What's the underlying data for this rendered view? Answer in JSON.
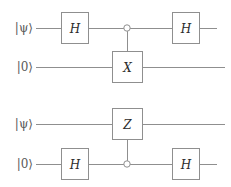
{
  "figure": {
    "background_color": "#ffffff",
    "line_color": "#8f8f8f",
    "text_color": "#2b2b2b",
    "label_color": "#5a5a5a"
  },
  "circuits": [
    {
      "id": "circuit-top",
      "description": "Controlled-X (CNOT) with open control on the top wire, conjugated by Hadamards on the control line",
      "wires": [
        {
          "id": "top-wire-0",
          "label": "|ψ⟩",
          "y": 28
        },
        {
          "id": "top-wire-1",
          "label": "|0⟩",
          "y": 67
        }
      ],
      "gates": [
        {
          "id": "top-h-left",
          "label": "H",
          "wire": 0,
          "x": 75,
          "type": "box"
        },
        {
          "id": "top-control",
          "label": "",
          "wire": 0,
          "x": 127,
          "type": "control-open"
        },
        {
          "id": "top-x",
          "label": "X",
          "wire": 1,
          "x": 127,
          "type": "box"
        },
        {
          "id": "top-h-right",
          "label": "H",
          "wire": 0,
          "x": 186,
          "type": "box"
        }
      ],
      "connections": [
        {
          "id": "top-vertical",
          "from": "top-control",
          "to": "top-x"
        }
      ]
    },
    {
      "id": "circuit-bottom",
      "description": "Controlled-Z with open control on the bottom wire, conjugated by Hadamards on the control line",
      "wires": [
        {
          "id": "bottom-wire-0",
          "label": "|ψ⟩",
          "y": 124
        },
        {
          "id": "bottom-wire-1",
          "label": "|0⟩",
          "y": 164
        }
      ],
      "gates": [
        {
          "id": "bottom-z",
          "label": "Z",
          "wire": 0,
          "x": 127,
          "type": "box"
        },
        {
          "id": "bottom-h-left",
          "label": "H",
          "wire": 1,
          "x": 75,
          "type": "box"
        },
        {
          "id": "bottom-control",
          "label": "",
          "wire": 1,
          "x": 127,
          "type": "control-open"
        },
        {
          "id": "bottom-h-right",
          "label": "H",
          "wire": 1,
          "x": 186,
          "type": "box"
        }
      ],
      "connections": [
        {
          "id": "bottom-vertical",
          "from": "bottom-z",
          "to": "bottom-control"
        }
      ]
    }
  ],
  "labels": {
    "psi": "|ψ⟩",
    "zero": "|0⟩",
    "h": "H",
    "x": "X",
    "z": "Z"
  }
}
